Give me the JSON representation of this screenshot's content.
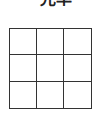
{
  "title": "光率",
  "grid": {
    "rows": 3,
    "cols": 3,
    "cells": [
      "",
      "",
      "",
      "",
      "",
      "",
      "",
      "",
      ""
    ],
    "line_color": "#333333"
  }
}
